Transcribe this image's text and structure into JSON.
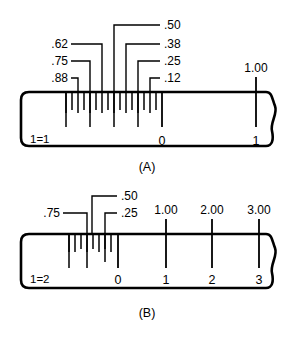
{
  "figure": {
    "background_color": "#ffffff",
    "ink_color": "#000000"
  },
  "panels": [
    {
      "id": "panel-a",
      "caption": "(A)",
      "ratio_label": "1=1",
      "zero_label": "0",
      "callouts": [
        {
          "value": ".62",
          "side": "left"
        },
        {
          "value": ".75",
          "side": "left"
        },
        {
          "value": ".88",
          "side": "left"
        },
        {
          "value": ".50",
          "side": "right"
        },
        {
          "value": ".38",
          "side": "right"
        },
        {
          "value": ".25",
          "side": "right"
        },
        {
          "value": ".12",
          "side": "right"
        }
      ],
      "major_labels": [
        {
          "top": "1.00",
          "bottom": "1"
        }
      ]
    },
    {
      "id": "panel-b",
      "caption": "(B)",
      "ratio_label": "1=2",
      "zero_label": "0",
      "callouts": [
        {
          "value": ".75",
          "side": "left"
        },
        {
          "value": ".50",
          "side": "right"
        },
        {
          "value": ".25",
          "side": "right"
        }
      ],
      "major_labels": [
        {
          "top": "1.00",
          "bottom": "1"
        },
        {
          "top": "2.00",
          "bottom": "2"
        },
        {
          "top": "3.00",
          "bottom": "3"
        }
      ]
    }
  ]
}
